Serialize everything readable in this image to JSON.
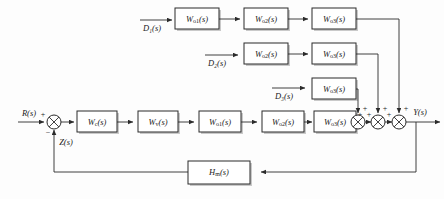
{
  "diagram": {
    "colors": {
      "line": "#2b2b2b",
      "block_fill": "#ffffff",
      "shadow": "#c9c9c9",
      "background": "#fdfdfd"
    },
    "signals": {
      "reference": "R(s)",
      "feedback": "Z(s)",
      "output": "Y(s)",
      "disturbance_1": "D₁(s)",
      "disturbance_2": "D₂(s)",
      "disturbance_3": "D₃(s)"
    },
    "signs": {
      "reference_sign": "+",
      "feedback_sign": "−",
      "sum_left_sign": "+",
      "sum_top_sign": "+"
    },
    "forward_path": [
      {
        "base": "W",
        "subscript": "c",
        "arg": "(s)",
        "label": "Wc(s)"
      },
      {
        "base": "W",
        "subscript": "v",
        "arg": "(s)",
        "label": "Wv(s)"
      },
      {
        "base": "W",
        "subscript": "o1",
        "arg": "(s)",
        "label": "Wo1(s)"
      },
      {
        "base": "W",
        "subscript": "o2",
        "arg": "(s)",
        "label": "Wo2(s)"
      },
      {
        "base": "W",
        "subscript": "o3",
        "arg": "(s)",
        "label": "Wo3(s)"
      }
    ],
    "disturbance_row_1": [
      {
        "base": "W",
        "subscript": "o1",
        "arg": "(s)",
        "label": "Wo1(s)"
      },
      {
        "base": "W",
        "subscript": "o2",
        "arg": "(s)",
        "label": "Wo2(s)"
      },
      {
        "base": "W",
        "subscript": "o3",
        "arg": "(s)",
        "label": "Wo3(s)"
      }
    ],
    "disturbance_row_2": [
      {
        "base": "W",
        "subscript": "o2",
        "arg": "(s)",
        "label": "Wo2(s)"
      },
      {
        "base": "W",
        "subscript": "o3",
        "arg": "(s)",
        "label": "Wo3(s)"
      }
    ],
    "disturbance_row_3": [
      {
        "base": "W",
        "subscript": "o3",
        "arg": "(s)",
        "label": "Wo3(s)"
      }
    ],
    "feedback_block": {
      "base": "H",
      "subscript": "m",
      "arg": "(s)",
      "label": "Hm(s)"
    }
  }
}
